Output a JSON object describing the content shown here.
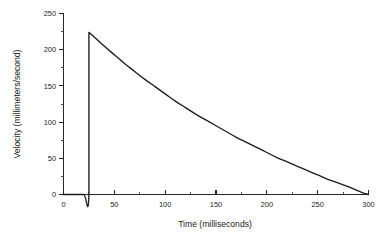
{
  "chart_data": {
    "type": "line",
    "title": "",
    "xlabel": "Time   (milliseconds)",
    "ylabel": "Velocity   (millimeters/second)",
    "xlim": [
      0,
      300
    ],
    "ylim": [
      0,
      250
    ],
    "grid": false,
    "legend": null,
    "x_ticks": [
      0,
      50,
      100,
      150,
      200,
      250,
      300
    ],
    "x_tick_labels": [
      "0",
      "50",
      "100",
      "150",
      "200",
      "250",
      "300"
    ],
    "x_minor_ticks": [
      25,
      75,
      125,
      175,
      225,
      275
    ],
    "y_ticks": [
      0,
      50,
      100,
      150,
      200,
      250
    ],
    "y_tick_labels": [
      "0",
      "50",
      "100",
      "150",
      "200",
      "250"
    ],
    "y_minor_ticks": [
      25,
      75,
      125,
      175,
      225
    ],
    "series": [
      {
        "name": "velocity",
        "color": "#1c1c1c",
        "x": [
          0,
          10,
          20,
          25,
          25,
          30,
          40,
          50,
          60,
          70,
          80,
          90,
          100,
          110,
          120,
          130,
          140,
          150,
          160,
          170,
          180,
          190,
          200,
          210,
          220,
          230,
          240,
          250,
          260,
          270,
          280,
          290,
          295,
          300
        ],
        "values": [
          0,
          0,
          0,
          0,
          224,
          218,
          205,
          193,
          181,
          170,
          159,
          149,
          139,
          129,
          120,
          111,
          103,
          95,
          87,
          79,
          72,
          65,
          58,
          51,
          45,
          39,
          33,
          27,
          21,
          16,
          11,
          5,
          2,
          0
        ]
      }
    ],
    "annotations": [
      "Velocity is zero until t = 25 ms, rises abruptly to a peak of about 224 mm/s, then decays smoothly to zero at t = 300 ms."
    ]
  }
}
